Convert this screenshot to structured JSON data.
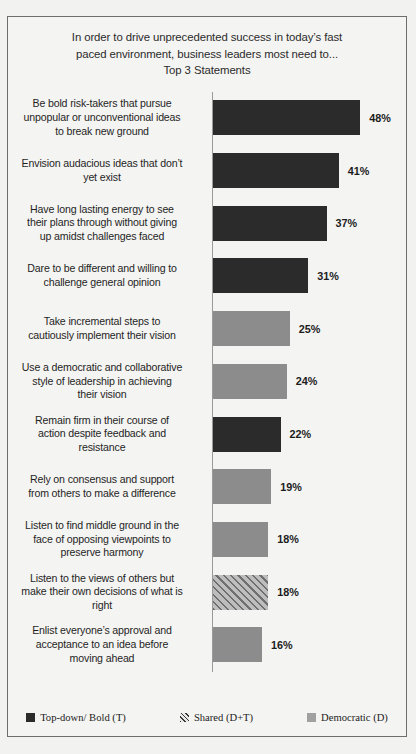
{
  "chart_data": {
    "type": "bar",
    "title": "In order to drive unprecedented success in today’s fast paced environment, business leaders most need to...\nTop 3 Statements",
    "title_lines": [
      "In order to drive unprecedented success in today’s fast",
      "paced environment, business leaders most need to...",
      "Top 3 Statements"
    ],
    "orientation": "horizontal",
    "xlabel": "",
    "ylabel": "",
    "xlim": [
      0,
      52
    ],
    "grid": false,
    "axis_visible": true,
    "value_suffix": "%",
    "legend_position": "bottom",
    "categories": [
      "Be bold risk-takers  that pursue unpopular or unconventional ideas to break new ground",
      "Envision audacious ideas that don’t yet exist",
      "Have long lasting energy to see their plans through without giving up amidst challenges faced",
      "Dare to be different and willing to challenge  general opinion",
      "Take incremental steps to cautiously implement their vision",
      "Use a democratic and collaborative style of leadership  in achieving their vision",
      "Remain firm in their course of action despite feedback and resistance",
      "Rely on consensus and support from others to make a difference",
      "Listen to find middle ground in the face of opposing viewpoints  to preserve harmony",
      "Listen to the views of others but make their own decisions of what is right",
      "Enlist everyone’s approval and acceptance to an idea before moving ahead"
    ],
    "values": [
      48,
      41,
      37,
      31,
      25,
      24,
      22,
      19,
      18,
      18,
      16
    ],
    "value_labels": [
      "48%",
      "41%",
      "37%",
      "31%",
      "25%",
      "24%",
      "22%",
      "19%",
      "18%",
      "18%",
      "16%"
    ],
    "series_of_bar": [
      "topdown",
      "topdown",
      "topdown",
      "topdown",
      "democratic",
      "democratic",
      "topdown",
      "democratic",
      "democratic",
      "shared",
      "democratic"
    ],
    "bars": [
      {
        "label_lines": [
          "Be bold risk-takers  that pursue",
          "unpopular or unconventional ideas",
          "to break new ground"
        ],
        "value": 48,
        "value_label": "48%",
        "series": "topdown"
      },
      {
        "label_lines": [
          "Envision audacious ideas that don’t",
          "yet exist"
        ],
        "value": 41,
        "value_label": "41%",
        "series": "topdown"
      },
      {
        "label_lines": [
          "Have long lasting energy to see",
          "their plans through without giving",
          "up amidst challenges faced"
        ],
        "value": 37,
        "value_label": "37%",
        "series": "topdown"
      },
      {
        "label_lines": [
          "Dare to be different and willing to",
          "challenge  general opinion"
        ],
        "value": 31,
        "value_label": "31%",
        "series": "topdown"
      },
      {
        "label_lines": [
          "Take incremental steps to",
          "cautiously implement their vision"
        ],
        "value": 25,
        "value_label": "25%",
        "series": "democratic"
      },
      {
        "label_lines": [
          "Use a democratic and collaborative",
          "style of leadership  in achieving",
          "their vision"
        ],
        "value": 24,
        "value_label": "24%",
        "series": "democratic"
      },
      {
        "label_lines": [
          "Remain firm in their course of",
          "action despite feedback and",
          "resistance"
        ],
        "value": 22,
        "value_label": "22%",
        "series": "topdown"
      },
      {
        "label_lines": [
          "Rely on consensus and support",
          "from others to make a difference"
        ],
        "value": 19,
        "value_label": "19%",
        "series": "democratic"
      },
      {
        "label_lines": [
          "Listen to find middle ground in the",
          "face of opposing viewpoints  to",
          "preserve harmony"
        ],
        "value": 18,
        "value_label": "18%",
        "series": "democratic"
      },
      {
        "label_lines": [
          "Listen to the views of others but",
          "make their own decisions of what is",
          "right"
        ],
        "value": 18,
        "value_label": "18%",
        "series": "shared"
      },
      {
        "label_lines": [
          "Enlist everyone’s approval and",
          "acceptance to an idea before",
          "moving ahead"
        ],
        "value": 16,
        "value_label": "16%",
        "series": "democratic"
      }
    ],
    "legend": [
      {
        "label": "Top-down/ Bold (T)",
        "series": "topdown",
        "color": "#2b2b2b"
      },
      {
        "label": "Shared (D+T)",
        "series": "shared",
        "color": "#a8a8a8"
      },
      {
        "label": "Democratic (D)",
        "series": "democratic",
        "color": "#a0a0a0"
      }
    ],
    "colors": {
      "topdown": "#2b2b2b",
      "shared": "#a8a8a8",
      "democratic": "#8c8c8c",
      "background": "#f4f4f2",
      "frame": "#6e6e6e",
      "text": "#1f1f1f"
    }
  }
}
